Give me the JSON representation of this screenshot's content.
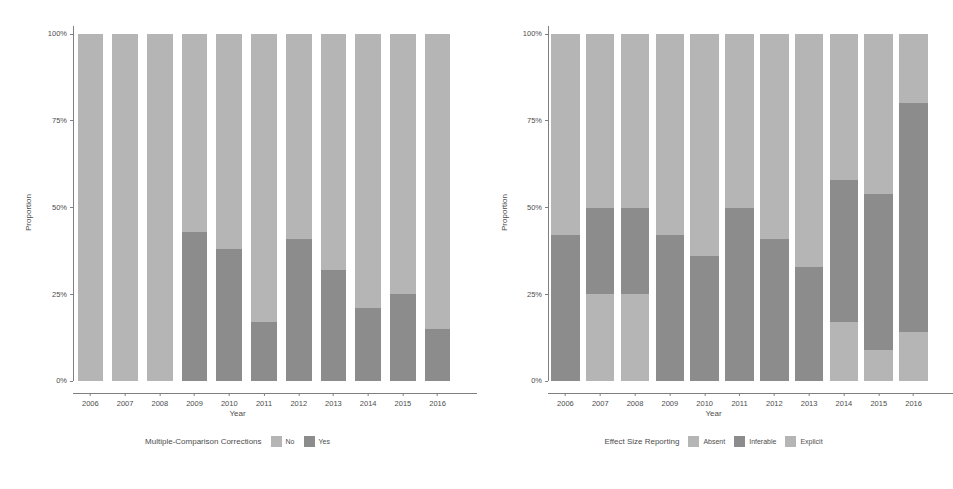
{
  "figure": {
    "background": "#ffffff",
    "width": 951,
    "height": 489
  },
  "palette": {
    "light_gray": "#b5b5b5",
    "dark_gray": "#8c8c8c",
    "axis": "#7f7f7f",
    "text": "#4d4d4d"
  },
  "chart_data": [
    {
      "type": "bar",
      "subtype": "stacked-100-percent",
      "panel": "left",
      "title": "",
      "xlabel": "Year",
      "ylabel": "Proportion",
      "ylim": [
        0,
        100
      ],
      "ytick_labels": [
        "0%",
        "25%",
        "50%",
        "75%",
        "100%"
      ],
      "ytick_values": [
        0,
        25,
        50,
        75,
        100
      ],
      "grid": false,
      "legend_title": "Multiple-Comparison Corrections",
      "legend_position": "bottom",
      "categories": [
        "2006",
        "2007",
        "2008",
        "2009",
        "2010",
        "2011",
        "2012",
        "2013",
        "2014",
        "2015",
        "2016"
      ],
      "series": [
        {
          "name": "Yes",
          "color": "#8c8c8c",
          "stack_order": 0,
          "values": [
            0,
            0,
            0,
            43,
            38,
            17,
            41,
            32,
            21,
            25,
            15
          ]
        },
        {
          "name": "No",
          "color": "#b5b5b5",
          "stack_order": 1,
          "values": [
            100,
            100,
            100,
            57,
            62,
            83,
            59,
            68,
            79,
            75,
            85
          ]
        }
      ]
    },
    {
      "type": "bar",
      "subtype": "stacked-100-percent",
      "panel": "right",
      "title": "",
      "xlabel": "Year",
      "ylabel": "Proportion",
      "ylim": [
        0,
        100
      ],
      "ytick_labels": [
        "0%",
        "25%",
        "50%",
        "75%",
        "100%"
      ],
      "ytick_values": [
        0,
        25,
        50,
        75,
        100
      ],
      "grid": false,
      "legend_title": "Effect Size Reporting",
      "legend_position": "bottom",
      "categories": [
        "2006",
        "2007",
        "2008",
        "2009",
        "2010",
        "2011",
        "2012",
        "2013",
        "2014",
        "2015",
        "2016"
      ],
      "series": [
        {
          "name": "Absent",
          "color": "#b5b5b5",
          "stack_order": 0,
          "values": [
            0,
            25,
            25,
            0,
            0,
            0,
            0,
            0,
            17,
            9,
            14
          ]
        },
        {
          "name": "Inferable",
          "color": "#8c8c8c",
          "stack_order": 1,
          "values": [
            42,
            25,
            25,
            42,
            36,
            50,
            41,
            33,
            41,
            45,
            66
          ]
        },
        {
          "name": "Explicit",
          "color": "#b5b5b5",
          "stack_order": 2,
          "values": [
            58,
            50,
            50,
            58,
            64,
            50,
            59,
            67,
            42,
            46,
            20
          ]
        }
      ]
    }
  ],
  "panels": {
    "left": {
      "y_axis_title": "Proportion",
      "x_axis_title": "Year",
      "ytick_labels": [
        "100%",
        "75%",
        "50%",
        "25%",
        "0%"
      ],
      "xtick_labels": [
        "2006",
        "2007",
        "2008",
        "2009",
        "2010",
        "2011",
        "2012",
        "2013",
        "2014",
        "2015",
        "2016"
      ],
      "legend": {
        "title": "Multiple-Comparison Corrections",
        "items": [
          {
            "label": "No",
            "color": "#b5b5b5"
          },
          {
            "label": "Yes",
            "color": "#8c8c8c"
          }
        ]
      }
    },
    "right": {
      "y_axis_title": "Proportion",
      "x_axis_title": "Year",
      "ytick_labels": [
        "100%",
        "75%",
        "50%",
        "25%",
        "0%"
      ],
      "xtick_labels": [
        "2006",
        "2007",
        "2008",
        "2009",
        "2010",
        "2011",
        "2012",
        "2013",
        "2014",
        "2015",
        "2016"
      ],
      "legend": {
        "title": "Effect Size Reporting",
        "items": [
          {
            "label": "Absent",
            "color": "#b5b5b5"
          },
          {
            "label": "Inferable",
            "color": "#8c8c8c"
          },
          {
            "label": "Explicit",
            "color": "#b5b5b5"
          }
        ]
      }
    }
  }
}
